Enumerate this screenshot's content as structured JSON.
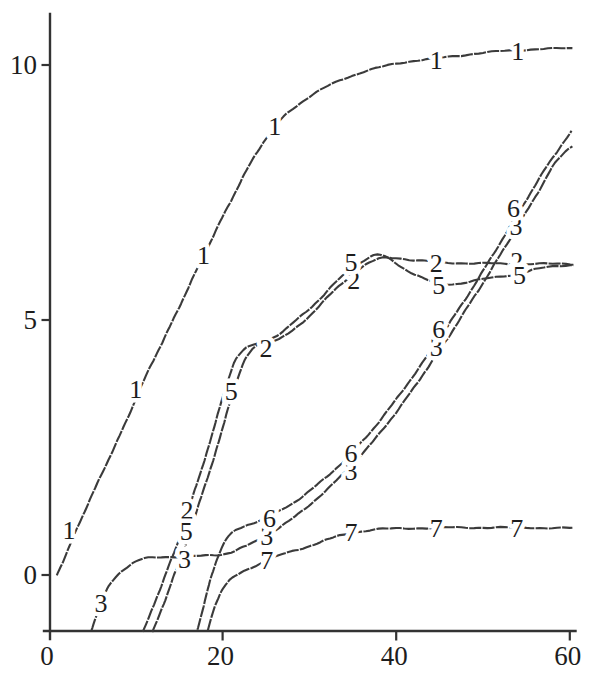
{
  "window": {
    "width": 597,
    "height": 689,
    "background": "#ffffff"
  },
  "style": {
    "curve_color": "#3b3b3b",
    "axis_color": "#333333",
    "text_color": "#1d1d1d"
  },
  "chart_data": {
    "type": "line",
    "title": "",
    "xlabel": "",
    "ylabel": "",
    "xlim": [
      0,
      60
    ],
    "ylim": [
      -1.1,
      11
    ],
    "x_ticks": [
      0,
      20,
      40,
      60
    ],
    "x_tick_labels": [
      "0",
      "20",
      "40",
      "60"
    ],
    "y_ticks": [
      0,
      5,
      10
    ],
    "y_tick_labels": [
      "0",
      "5",
      "10"
    ],
    "grid": false,
    "legend": "none; curves identified by inline number labels",
    "series": [
      {
        "name": "1",
        "points": [
          [
            0.9,
            0.0
          ],
          [
            2,
            0.42
          ],
          [
            3.2,
            0.9
          ],
          [
            4.5,
            1.4
          ],
          [
            6,
            1.95
          ],
          [
            7.5,
            2.5
          ],
          [
            9,
            3.05
          ],
          [
            10.5,
            3.65
          ],
          [
            12,
            4.2
          ],
          [
            13.5,
            4.72
          ],
          [
            15,
            5.25
          ],
          [
            16.5,
            5.8
          ],
          [
            18,
            6.32
          ],
          [
            19.5,
            6.85
          ],
          [
            21,
            7.35
          ],
          [
            22.5,
            7.85
          ],
          [
            24,
            8.3
          ],
          [
            25.5,
            8.68
          ],
          [
            27,
            8.98
          ],
          [
            28.9,
            9.25
          ],
          [
            31.2,
            9.5
          ],
          [
            33.5,
            9.7
          ],
          [
            35.8,
            9.84
          ],
          [
            38,
            9.95
          ],
          [
            40,
            10.03
          ],
          [
            42,
            10.08
          ],
          [
            44,
            10.12
          ],
          [
            46,
            10.16
          ],
          [
            48,
            10.2
          ],
          [
            50,
            10.24
          ],
          [
            52,
            10.27
          ],
          [
            54,
            10.29
          ],
          [
            56,
            10.31
          ],
          [
            58,
            10.32
          ],
          [
            60.3,
            10.33
          ]
        ],
        "labels": [
          [
            2.3,
            0.88
          ],
          [
            10.0,
            3.65
          ],
          [
            17.8,
            6.27
          ],
          [
            26.0,
            8.8
          ],
          [
            44.6,
            10.1
          ],
          [
            54.0,
            10.28
          ]
        ]
      },
      {
        "name": "2",
        "points": [
          [
            10.8,
            -1.12
          ],
          [
            11.6,
            -0.8
          ],
          [
            12.3,
            -0.49
          ],
          [
            13.1,
            -0.14
          ],
          [
            13.9,
            0.22
          ],
          [
            14.8,
            0.62
          ],
          [
            15.8,
            1.13
          ],
          [
            16.8,
            1.68
          ],
          [
            17.9,
            2.23
          ],
          [
            18.8,
            2.77
          ],
          [
            19.7,
            3.3
          ],
          [
            20.5,
            3.75
          ],
          [
            21.3,
            4.15
          ],
          [
            22.1,
            4.35
          ],
          [
            23.1,
            4.49
          ],
          [
            24.5,
            4.57
          ],
          [
            26.5,
            4.63
          ],
          [
            28.3,
            4.82
          ],
          [
            30,
            5.08
          ],
          [
            31.7,
            5.38
          ],
          [
            33.4,
            5.66
          ],
          [
            35,
            5.9
          ],
          [
            36.5,
            6.08
          ],
          [
            38,
            6.2
          ],
          [
            39,
            6.23
          ],
          [
            40.5,
            6.21
          ],
          [
            42,
            6.17
          ],
          [
            43.5,
            6.15
          ],
          [
            45,
            6.13
          ],
          [
            47,
            6.12
          ],
          [
            49,
            6.11
          ],
          [
            51,
            6.11
          ],
          [
            53,
            6.1
          ],
          [
            55,
            6.1
          ],
          [
            57,
            6.1
          ],
          [
            59,
            6.1
          ],
          [
            60.4,
            6.1
          ]
        ],
        "labels": [
          [
            15.9,
            1.28
          ],
          [
            25.0,
            4.45
          ],
          [
            35.1,
            5.78
          ],
          [
            44.6,
            6.12
          ],
          [
            53.9,
            6.16
          ]
        ]
      },
      {
        "name": "3",
        "points": [
          [
            4.9,
            -1.08
          ],
          [
            5.6,
            -0.72
          ],
          [
            6.3,
            -0.42
          ],
          [
            7.1,
            -0.17
          ],
          [
            8.0,
            0.02
          ],
          [
            9.0,
            0.16
          ],
          [
            10.0,
            0.26
          ],
          [
            11,
            0.32
          ],
          [
            12.5,
            0.35
          ],
          [
            15,
            0.36
          ],
          [
            17,
            0.37
          ],
          [
            18.5,
            0.38
          ],
          [
            19.8,
            0.4
          ],
          [
            21,
            0.45
          ],
          [
            22,
            0.52
          ],
          [
            23.5,
            0.63
          ],
          [
            25,
            0.77
          ],
          [
            26.5,
            0.93
          ],
          [
            28,
            1.1
          ],
          [
            29.5,
            1.3
          ],
          [
            31,
            1.52
          ],
          [
            32.5,
            1.75
          ],
          [
            34,
            2.0
          ],
          [
            35.5,
            2.27
          ],
          [
            37,
            2.55
          ],
          [
            38.5,
            2.87
          ],
          [
            40,
            3.19
          ],
          [
            41.5,
            3.54
          ],
          [
            43,
            3.91
          ],
          [
            44.5,
            4.28
          ],
          [
            46,
            4.66
          ],
          [
            47.5,
            5.06
          ],
          [
            49,
            5.46
          ],
          [
            50.5,
            5.86
          ],
          [
            52,
            6.28
          ],
          [
            53.5,
            6.7
          ],
          [
            55,
            7.12
          ],
          [
            56.5,
            7.55
          ],
          [
            58,
            8.0
          ],
          [
            59.5,
            8.3
          ],
          [
            60.3,
            8.42
          ]
        ],
        "labels": [
          [
            6.0,
            -0.55
          ],
          [
            15.6,
            0.31
          ],
          [
            25.1,
            0.77
          ],
          [
            34.8,
            2.03
          ],
          [
            44.6,
            4.47
          ],
          [
            53.8,
            6.85
          ]
        ]
      },
      {
        "name": "5",
        "points": [
          [
            11.9,
            -1.12
          ],
          [
            12.7,
            -0.8
          ],
          [
            13.4,
            -0.49
          ],
          [
            14.1,
            -0.14
          ],
          [
            14.9,
            0.22
          ],
          [
            15.8,
            0.62
          ],
          [
            16.8,
            1.13
          ],
          [
            17.8,
            1.68
          ],
          [
            18.9,
            2.23
          ],
          [
            19.8,
            2.77
          ],
          [
            20.7,
            3.3
          ],
          [
            21.5,
            3.73
          ],
          [
            22.3,
            4.12
          ],
          [
            23.1,
            4.35
          ],
          [
            24.1,
            4.52
          ],
          [
            25.5,
            4.63
          ],
          [
            27,
            4.78
          ],
          [
            28.5,
            5.0
          ],
          [
            30,
            5.22
          ],
          [
            31.7,
            5.5
          ],
          [
            33.4,
            5.8
          ],
          [
            35,
            6.02
          ],
          [
            36.3,
            6.17
          ],
          [
            37.4,
            6.26
          ],
          [
            38.3,
            6.27
          ],
          [
            39.5,
            6.17
          ],
          [
            41,
            6.0
          ],
          [
            42.5,
            5.86
          ],
          [
            44,
            5.76
          ],
          [
            45.5,
            5.71
          ],
          [
            47,
            5.71
          ],
          [
            48.5,
            5.75
          ],
          [
            50,
            5.8
          ],
          [
            51.5,
            5.84
          ],
          [
            53,
            5.88
          ],
          [
            54.5,
            5.92
          ],
          [
            56,
            5.99
          ],
          [
            57.5,
            6.04
          ],
          [
            59,
            6.07
          ],
          [
            60.4,
            6.08
          ]
        ],
        "labels": [
          [
            15.8,
            0.86
          ],
          [
            21.0,
            3.6
          ],
          [
            34.8,
            6.14
          ],
          [
            44.9,
            5.68
          ],
          [
            54.2,
            5.88
          ]
        ]
      },
      {
        "name": "6",
        "points": [
          [
            17.1,
            -1.08
          ],
          [
            17.7,
            -0.68
          ],
          [
            18.3,
            -0.28
          ],
          [
            18.9,
            0.08
          ],
          [
            19.5,
            0.38
          ],
          [
            20.1,
            0.6
          ],
          [
            20.7,
            0.76
          ],
          [
            21.5,
            0.87
          ],
          [
            22.5,
            0.96
          ],
          [
            24,
            1.05
          ],
          [
            25.5,
            1.15
          ],
          [
            27,
            1.3
          ],
          [
            28.8,
            1.49
          ],
          [
            30.5,
            1.71
          ],
          [
            32,
            1.93
          ],
          [
            33.5,
            2.16
          ],
          [
            35,
            2.41
          ],
          [
            36.5,
            2.7
          ],
          [
            38,
            3.0
          ],
          [
            39.5,
            3.33
          ],
          [
            41,
            3.68
          ],
          [
            42.5,
            4.03
          ],
          [
            44,
            4.4
          ],
          [
            45.5,
            4.77
          ],
          [
            47,
            5.16
          ],
          [
            48.5,
            5.55
          ],
          [
            50,
            5.96
          ],
          [
            51.5,
            6.38
          ],
          [
            53,
            6.8
          ],
          [
            54.5,
            7.22
          ],
          [
            56,
            7.64
          ],
          [
            57.5,
            8.05
          ],
          [
            59,
            8.42
          ],
          [
            60.2,
            8.7
          ]
        ],
        "labels": [
          [
            25.4,
            1.12
          ],
          [
            34.8,
            2.4
          ],
          [
            44.9,
            4.83
          ],
          [
            53.5,
            7.2
          ]
        ]
      },
      {
        "name": "7",
        "points": [
          [
            18.3,
            -1.08
          ],
          [
            18.9,
            -0.73
          ],
          [
            19.5,
            -0.45
          ],
          [
            20.1,
            -0.24
          ],
          [
            20.8,
            -0.1
          ],
          [
            21.5,
            -0.02
          ],
          [
            22.5,
            0.07
          ],
          [
            23.8,
            0.18
          ],
          [
            25.2,
            0.3
          ],
          [
            26.8,
            0.4
          ],
          [
            28.8,
            0.5
          ],
          [
            30.5,
            0.6
          ],
          [
            32,
            0.69
          ],
          [
            33.5,
            0.77
          ],
          [
            35,
            0.83
          ],
          [
            36.5,
            0.87
          ],
          [
            38,
            0.9
          ],
          [
            40,
            0.91
          ],
          [
            43,
            0.92
          ],
          [
            46,
            0.93
          ],
          [
            49,
            0.93
          ],
          [
            52,
            0.93
          ],
          [
            55,
            0.93
          ],
          [
            58,
            0.92
          ],
          [
            60.3,
            0.92
          ]
        ],
        "labels": [
          [
            25.1,
            0.3
          ],
          [
            34.8,
            0.84
          ],
          [
            44.6,
            0.93
          ],
          [
            53.9,
            0.93
          ]
        ]
      }
    ]
  }
}
